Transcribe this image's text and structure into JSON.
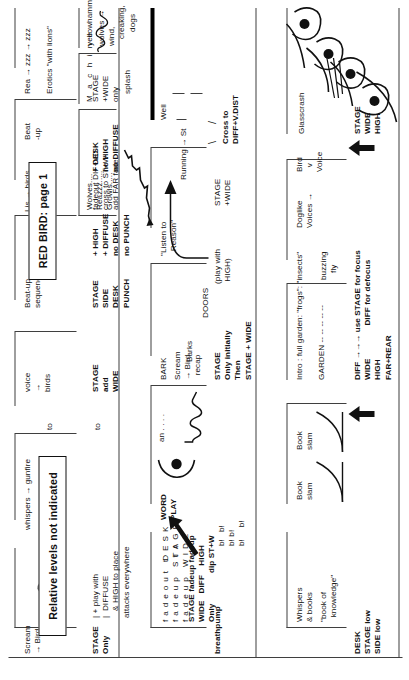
{
  "document": {
    "title": "RED BIRD: page 1",
    "note_box": "Relative levels not indicated",
    "orientation": "rotated-90-ccw",
    "ink_color": "#111111",
    "rule_color": "#3f3f3f",
    "paper_color": "#ffffff"
  },
  "systems": {
    "row1_label": "Scream\n→ Bird",
    "row_bottom_label": ""
  },
  "cues": [
    {
      "id": "scream-bird",
      "text": "Scream\n→ Bird"
    },
    {
      "id": "whispers-gunfire",
      "text": "whispers → gunfire"
    },
    {
      "id": "to",
      "text": "to"
    },
    {
      "id": "voice-birds",
      "text": "voice\n→\nbirds"
    },
    {
      "id": "beat-up-sequence",
      "text": "Beat-up\nsequence"
    },
    {
      "id": "lis-birds",
      "text": "Lis → birds"
    },
    {
      "id": "beat-up",
      "text": "Beat\n-up"
    },
    {
      "id": "rea-zzz",
      "text": "Rea → zzz → zzz"
    },
    {
      "id": "erotics-lions",
      "text": "Erotics \"with lions\""
    },
    {
      "id": "wolves-reazzz-growls",
      "text": "Wolves....\nReazzz.....\nGrowls....."
    },
    {
      "id": "machine",
      "text": "M a c h i n e"
    },
    {
      "id": "yellowhammer",
      "text": "yellowhammer"
    },
    {
      "id": "wolves-wind",
      "text": "wolves →\nwind,\n   creaking,\n      dogs"
    },
    {
      "id": "stage-only",
      "text": "STAGE\nOnly"
    },
    {
      "id": "play-with-diffuse",
      "text": "| + play with\n|  DIFFUSE\n   & HIGH to place\nattacks everywhere"
    },
    {
      "id": "to-2",
      "text": "to"
    },
    {
      "id": "stage-add-wide",
      "text": "STAGE\nadd\nWIDE"
    },
    {
      "id": "stage-side-desk-punch",
      "text": "STAGE\nSIDE\nDESK\nPUNCH"
    },
    {
      "id": "plus-high-diffuse",
      "text": "+ HIGH\n+ DIFFUSE\nno DESK\nno PUNCH"
    },
    {
      "id": "plus-desk",
      "text": "+ DESK\nno HIGH\nno DIFFUSE"
    },
    {
      "id": "fadeout-desk",
      "text": "fadeout DESK\nfadeup STAGE\nfadeup WIDE"
    },
    {
      "id": "stage-wide-only",
      "text": "STAGE fadeup fadeup\nWIDE   DIFF    HIGH\nOnly             dip ST+W"
    },
    {
      "id": "t-t-t",
      "text": "t\n  t   t"
    },
    {
      "id": "word-play",
      "text": "WORD\nPLAY"
    },
    {
      "id": "an",
      "text": "an . . . ."
    },
    {
      "id": "bark",
      "text": "BARK"
    },
    {
      "id": "scream-bird-recap",
      "text": "Scream\n→ Bird\n  recap"
    },
    {
      "id": "barks",
      "text": "Barks"
    },
    {
      "id": "doors",
      "text": "DOORS"
    },
    {
      "id": "listen-to-reason",
      "text": "\"Listen to\n  Reason\""
    },
    {
      "id": "running-to-st",
      "text": "Running → St"
    },
    {
      "id": "well",
      "text": "Well"
    },
    {
      "id": "splash",
      "text": "splash"
    },
    {
      "id": "breathpump",
      "text": "breathpump"
    },
    {
      "id": "bl-group",
      "text": "b!   b!\nb! b!\nb!     b!"
    },
    {
      "id": "stage-only-initially",
      "text": "STAGE\nOnly initially\nThen\nSTAGE + WIDE"
    },
    {
      "id": "play-with-high",
      "text": "(play with\n HIGH)"
    },
    {
      "id": "stage-plus-wide",
      "text": "STAGE\n+WIDE"
    },
    {
      "id": "cross-to-diff-vdist",
      "text": "Cross to\nDIFF+V.DIST"
    },
    {
      "id": "fadeout-cross",
      "text": "fadeout DIF+VD\ncross to ST+W\nadd FAR fade"
    },
    {
      "id": "stage-wide-only-2",
      "text": "STAGE\n+WIDE\nonly"
    },
    {
      "id": "whispers-books",
      "text": "Whispers\n& books"
    },
    {
      "id": "book-of-knowledge",
      "text": "\"book of\n  knowledge\""
    },
    {
      "id": "book-slam-1",
      "text": "Book\nslam"
    },
    {
      "id": "book-slam-2",
      "text": "Book\nslam"
    },
    {
      "id": "intro-full-garden",
      "text": "Intro : full garden: \"frogs\": \"insects\""
    },
    {
      "id": "garden",
      "text": "GARDEN -- -- -- -- --"
    },
    {
      "id": "buzzing-fly",
      "text": "buzzing\n   fly"
    },
    {
      "id": "doglike-voices",
      "text": "Doglike\nVoices →"
    },
    {
      "id": "bird-v-voice",
      "text": "Bird\n  v\nVoice"
    },
    {
      "id": "glasscrash",
      "text": "Glasscrash"
    },
    {
      "id": "desk-stage-side-low",
      "text": "DESK\nSTAGE low\nSIDE low"
    },
    {
      "id": "diff-use-stage",
      "text": "DIFF →→→ use STAGE for focus\nWIDE              DIFF for defocus\nHIGH\nFAR+REAR"
    },
    {
      "id": "stage-wide-high",
      "text": "STAGE\nWIDE\nHIGH"
    }
  ]
}
